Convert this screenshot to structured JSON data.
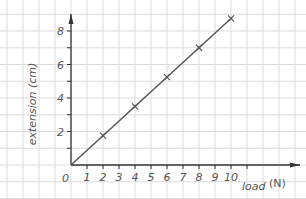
{
  "chart_data": {
    "type": "line",
    "title": "",
    "xlabel": "load (N)",
    "ylabel": "extension (cm)",
    "origin_label": "0",
    "x_ticks": [
      1,
      2,
      3,
      4,
      5,
      6,
      7,
      8,
      9,
      10
    ],
    "y_ticks": [
      2,
      4,
      6,
      8
    ],
    "xlim": [
      0,
      13
    ],
    "ylim": [
      0,
      9
    ],
    "grid": true,
    "legend": null,
    "series": [
      {
        "name": "extension",
        "marker": "x",
        "x": [
          2,
          4,
          6,
          8,
          10
        ],
        "y": [
          1.75,
          3.5,
          5.25,
          7.0,
          8.75
        ]
      }
    ],
    "best_fit_line": {
      "from": [
        0,
        0
      ],
      "to": [
        10,
        8.75
      ]
    },
    "colors": {
      "line": "#555555",
      "grid": "#dcdcdc",
      "axis": "#333333",
      "text": "#555555"
    }
  }
}
